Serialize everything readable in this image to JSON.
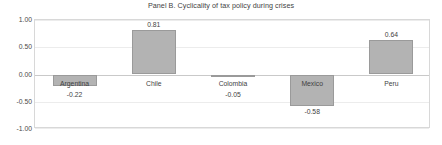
{
  "chart_data": {
    "type": "bar",
    "title": "Panel B. Cyclicality of tax policy  during crises",
    "xlabel": "",
    "ylabel": "",
    "categories": [
      "Argentina",
      "Chile",
      "Colombia",
      "Mexico",
      "Peru"
    ],
    "values": [
      -0.22,
      0.81,
      -0.05,
      -0.58,
      0.64
    ],
    "value_labels": [
      "-0.22",
      "0.81",
      "-0.05",
      "-0.58",
      "0.64"
    ],
    "ylim": [
      -1.0,
      1.0
    ],
    "yticks": [
      1.0,
      0.5,
      0.0,
      -0.5,
      -1.0
    ],
    "ytick_labels": [
      "1.00",
      "0.50",
      "0.00",
      "-0.50",
      "-1.00"
    ],
    "grid": true,
    "legend": false,
    "bar_color": "#b3b3b3",
    "bar_border_color": "#9a9a9a",
    "gridline_color": "#ececec",
    "zero_line_color": "#c9c9c9",
    "frame_color": "#d8d8d8",
    "text_color": "#3f3f3f"
  }
}
